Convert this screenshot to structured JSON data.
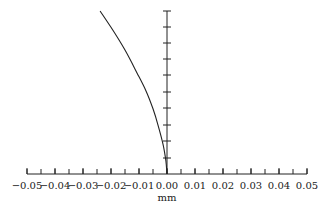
{
  "chart_data": {
    "type": "line",
    "title": "",
    "xlabel": "mm",
    "ylabel": "",
    "xlim": [
      -0.05,
      0.05
    ],
    "x_ticks": [
      -0.05,
      -0.04,
      -0.03,
      -0.02,
      -0.01,
      0.0,
      0.01,
      0.02,
      0.03,
      0.04,
      0.05
    ],
    "x_tick_labels": [
      "−0.05",
      "−0.04",
      "−0.03",
      "−0.02",
      "−0.01",
      "0.00",
      "0.01",
      "0.02",
      "0.03",
      "0.04",
      "0.05"
    ],
    "x_minor_step": 0.005,
    "y_axis": {
      "position": "x=0",
      "tick_count": 10,
      "tick_labels": [],
      "range_normalized": [
        0,
        1
      ]
    },
    "grid": false,
    "legend": null,
    "series": [
      {
        "name": "curve",
        "color": "#222222",
        "points": [
          {
            "x": -0.0239,
            "y": 1.0
          },
          {
            "x": -0.02,
            "y": 0.9
          },
          {
            "x": -0.015,
            "y": 0.76
          },
          {
            "x": -0.0107,
            "y": 0.62
          },
          {
            "x": -0.0075,
            "y": 0.51
          },
          {
            "x": -0.005,
            "y": 0.4
          },
          {
            "x": -0.0032,
            "y": 0.3
          },
          {
            "x": -0.0014,
            "y": 0.18
          },
          {
            "x": -0.0004,
            "y": 0.08
          },
          {
            "x": 0.0,
            "y": 0.0
          }
        ]
      }
    ]
  },
  "layout": {
    "x_left_px": 27,
    "x_right_px": 307,
    "x_axis_y_px": 174,
    "y_top_px": 11,
    "y_bottom_px": 174,
    "y_tick_px": [
      11,
      27,
      43,
      59,
      75,
      92,
      108,
      125,
      141,
      158
    ]
  }
}
